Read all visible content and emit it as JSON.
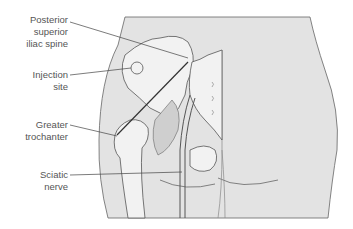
{
  "diagram": {
    "labels": [
      {
        "id": "psis",
        "lines": [
          "Posterior",
          "superior",
          "iliac spine"
        ]
      },
      {
        "id": "injection",
        "lines": [
          "Injection",
          "site"
        ]
      },
      {
        "id": "trochanter",
        "lines": [
          "Greater",
          "trochanter"
        ]
      },
      {
        "id": "sciatic",
        "lines": [
          "Sciatic",
          "nerve"
        ]
      }
    ],
    "colors": {
      "skin": "#e3e3e3",
      "bone": "#f2f2f2",
      "shadow": "#cfcfcf",
      "outline": "#555555",
      "text": "#555555"
    }
  }
}
